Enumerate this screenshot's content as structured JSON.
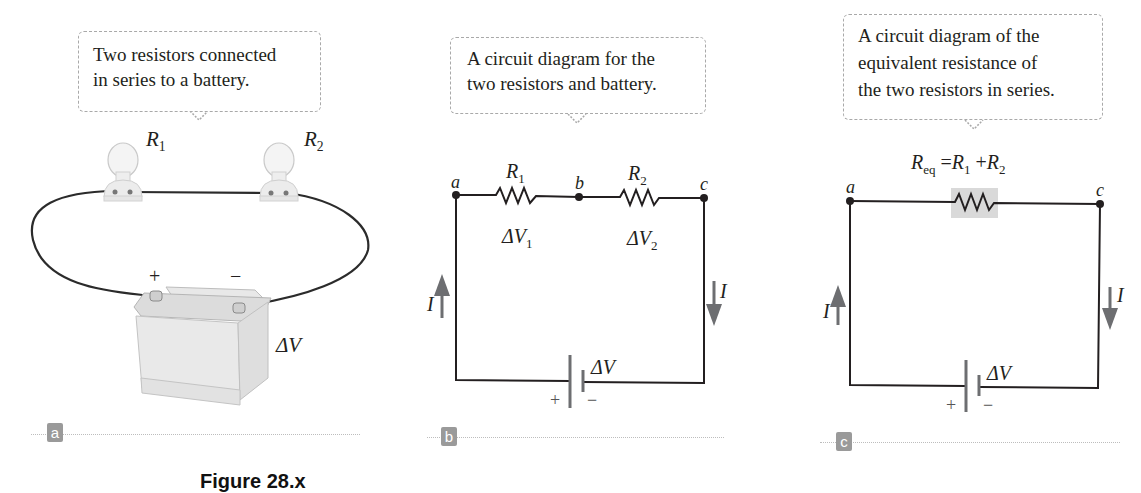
{
  "panels": [
    {
      "id": "a",
      "label": "a",
      "callout": [
        "Two resistors connected",
        "in series to a battery."
      ],
      "labels": {
        "r1": "R",
        "r1_sub": "1",
        "r2": "R",
        "r2_sub": "2",
        "battery_plus": "+",
        "battery_minus": "−",
        "delta_v": "ΔV"
      }
    },
    {
      "id": "b",
      "label": "b",
      "callout": [
        "A circuit diagram for the",
        "two resistors and battery."
      ],
      "labels": {
        "node_a": "a",
        "node_b": "b",
        "node_c": "c",
        "r1": "R",
        "r1_sub": "1",
        "r2": "R",
        "r2_sub": "2",
        "dv1": "ΔV",
        "dv1_sub": "1",
        "dv2": "ΔV",
        "dv2_sub": "2",
        "current_left": "I",
        "current_right": "I",
        "battery_plus": "+",
        "battery_minus": "−",
        "delta_v": "ΔV"
      }
    },
    {
      "id": "c",
      "label": "c",
      "callout": [
        "A circuit diagram of the",
        "equivalent resistance of",
        "the two resistors in series."
      ],
      "labels": {
        "equation_lhs": "R",
        "equation_lhs_sub": "eq",
        "equation_eq": "=",
        "equation_r1": "R",
        "equation_r1_sub": "1",
        "equation_plus": "+",
        "equation_r2": "R",
        "equation_r2_sub": "2",
        "node_a": "a",
        "node_c": "c",
        "current_left": "I",
        "current_right": "I",
        "battery_plus": "+",
        "battery_minus": "−",
        "delta_v": "ΔV"
      }
    }
  ],
  "caption": "Figure 28.x",
  "colors": {
    "wire": "#231f20",
    "arrow": "#6d6e71",
    "label_box": "#9a9a9a",
    "resistor_highlight": "#d9d9d9",
    "callout_border": "#a9a9a9"
  }
}
